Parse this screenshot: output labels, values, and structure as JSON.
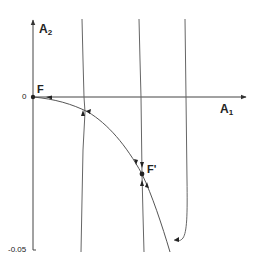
{
  "diagram": {
    "axes": {
      "x_label": "A",
      "x_label_sub": "1",
      "y_label": "A",
      "y_label_sub": "2"
    },
    "ticks": {
      "zero": "0",
      "bottom": "-0.05"
    },
    "points": {
      "fixed_point_1": "F",
      "fixed_point_2": "F'"
    },
    "colors": {
      "line": "#555555",
      "text": "#222222",
      "background": "#ffffff"
    }
  }
}
